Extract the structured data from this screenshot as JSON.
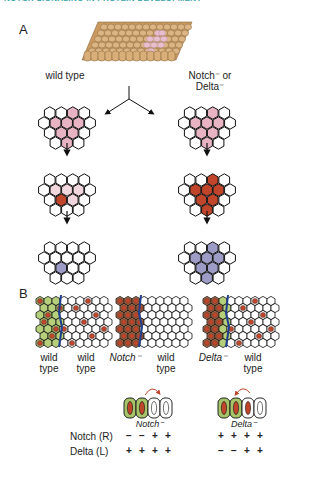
{
  "header": "NOTCH SIGNALING IN PROTEIN DEVELOPMENT",
  "panels": {
    "a": "A",
    "b": "B"
  },
  "panel_a": {
    "left_label": "wild type",
    "right_label_1": "Notch⁻ or",
    "right_label_2": "Delta⁻"
  },
  "panel_b": {
    "group1": {
      "left": "wild\ntype",
      "right": "wild\ntype",
      "left_1": "wild",
      "left_2": "type",
      "right_1": "wild",
      "right_2": "type"
    },
    "group2": {
      "left": "Notch⁻",
      "right_1": "wild",
      "right_2": "type"
    },
    "group3": {
      "left": "Delta⁻",
      "right_1": "wild",
      "right_2": "type"
    },
    "cells_notch_caption": "Notch⁻",
    "cells_delta_caption": "Delta⁻",
    "table": {
      "notch_label": "Notch (R)",
      "delta_label": "Delta (L)",
      "notch_minus": {
        "notch": [
          "−",
          "−",
          "+",
          "+"
        ],
        "delta": [
          "+",
          "+",
          "+",
          "+"
        ]
      },
      "delta_minus": {
        "notch": [
          "+",
          "+",
          "+",
          "+"
        ],
        "delta": [
          "−",
          "−",
          "+",
          "+"
        ]
      }
    }
  },
  "colors": {
    "header": "#3aa3a8",
    "pink": "#e8b4c4",
    "light_pink": "#f1d6dd",
    "red": "#c0452a",
    "lavender": "#9d9cc7",
    "green": "#b5cf7a",
    "blue_line": "#1f3f8f",
    "tan": "#d8b083"
  }
}
